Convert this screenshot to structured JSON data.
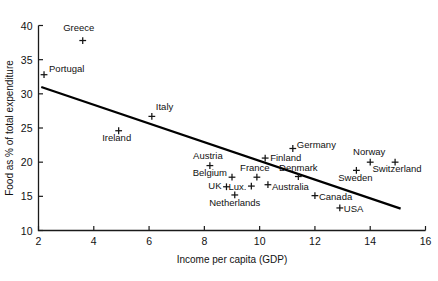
{
  "chart_data": {
    "type": "scatter",
    "title": "",
    "xlabel": "Income per capita (GDP)",
    "ylabel": "Food as % of total expenditure",
    "xlim": [
      2,
      16
    ],
    "ylim": [
      10,
      40
    ],
    "xticks": [
      2,
      4,
      6,
      8,
      10,
      12,
      14,
      16
    ],
    "yticks": [
      10,
      15,
      20,
      25,
      30,
      35,
      40
    ],
    "grid": false,
    "legend": "none",
    "points": [
      {
        "label": "Greece",
        "x": 3.6,
        "y": 37.8,
        "label_dx": -4,
        "label_dy": -10,
        "anchor": "middle"
      },
      {
        "label": "Portugal",
        "x": 2.2,
        "y": 32.8,
        "label_dx": 5,
        "label_dy": -3,
        "anchor": "start"
      },
      {
        "label": "Italy",
        "x": 6.1,
        "y": 26.7,
        "label_dx": 4,
        "label_dy": -6,
        "anchor": "start"
      },
      {
        "label": "Ireland",
        "x": 4.9,
        "y": 24.6,
        "label_dx": -2,
        "label_dy": 10,
        "anchor": "middle"
      },
      {
        "label": "Germany",
        "x": 11.2,
        "y": 22.0,
        "label_dx": 4,
        "label_dy": -1,
        "anchor": "start"
      },
      {
        "label": "Finland",
        "x": 10.2,
        "y": 20.6,
        "label_dx": 5,
        "label_dy": 3,
        "anchor": "start"
      },
      {
        "label": "Austria",
        "x": 8.2,
        "y": 19.5,
        "label_dx": -2,
        "label_dy": -7,
        "anchor": "middle"
      },
      {
        "label": "Norway",
        "x": 14.0,
        "y": 20.0,
        "label_dx": -1,
        "label_dy": -7,
        "anchor": "middle"
      },
      {
        "label": "Switzerland",
        "x": 14.9,
        "y": 20.0,
        "label_dx": 2,
        "label_dy": 10,
        "anchor": "middle"
      },
      {
        "label": "Sweden",
        "x": 13.5,
        "y": 18.8,
        "label_dx": -1,
        "label_dy": 11,
        "anchor": "middle"
      },
      {
        "label": "Denmark",
        "x": 11.4,
        "y": 17.9,
        "label_dx": 0,
        "label_dy": -6,
        "anchor": "middle"
      },
      {
        "label": "Belgium",
        "x": 9.0,
        "y": 17.8,
        "label_dx": -5,
        "label_dy": -1,
        "anchor": "end"
      },
      {
        "label": "France",
        "x": 9.9,
        "y": 17.8,
        "label_dx": -2,
        "label_dy": -6,
        "anchor": "middle"
      },
      {
        "label": "Lux.",
        "x": 9.7,
        "y": 16.5,
        "label_dx": -5,
        "label_dy": 4,
        "anchor": "end"
      },
      {
        "label": "Australia",
        "x": 10.3,
        "y": 16.7,
        "label_dx": 4,
        "label_dy": 5,
        "anchor": "start"
      },
      {
        "label": "UK",
        "x": 8.8,
        "y": 16.4,
        "label_dx": -5,
        "label_dy": 2,
        "anchor": "end"
      },
      {
        "label": "Netherlands",
        "x": 9.1,
        "y": 15.2,
        "label_dx": 0,
        "label_dy": 11,
        "anchor": "middle"
      },
      {
        "label": "Canada",
        "x": 12.0,
        "y": 15.1,
        "label_dx": 4,
        "label_dy": 4,
        "anchor": "start"
      },
      {
        "label": "USA",
        "x": 12.9,
        "y": 13.3,
        "label_dx": 4,
        "label_dy": 4,
        "anchor": "start"
      }
    ],
    "trendline": {
      "name": "regression-line",
      "x0": 2.1,
      "y0": 31.0,
      "x1": 15.1,
      "y1": 13.2
    }
  }
}
